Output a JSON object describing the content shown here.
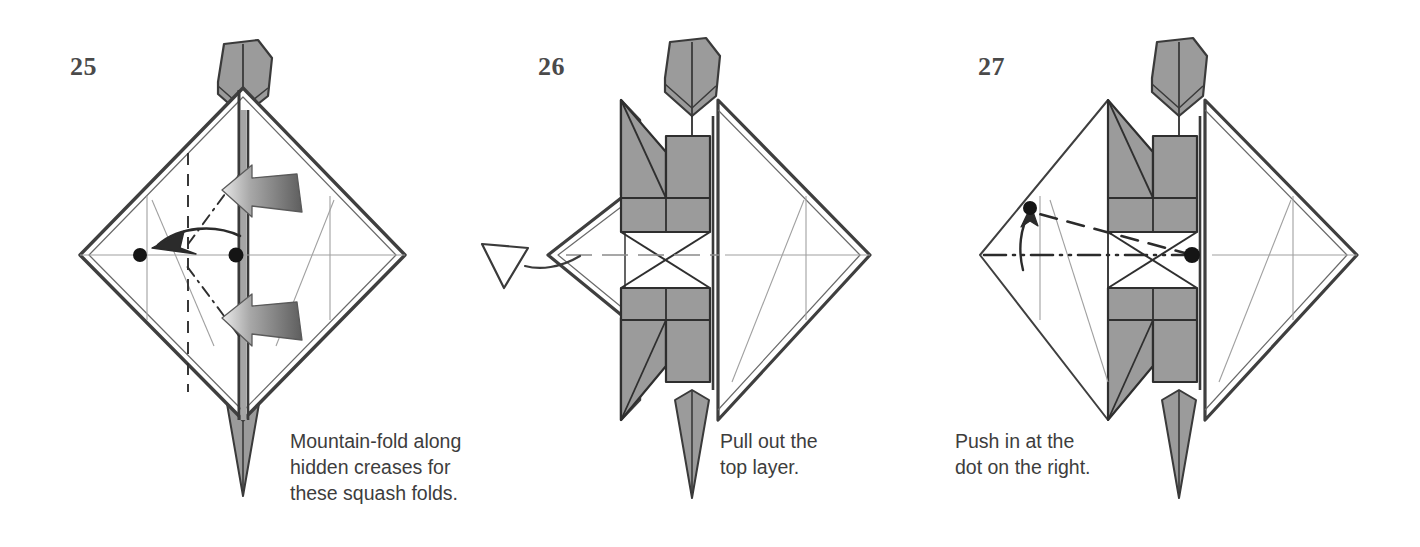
{
  "page": {
    "type": "origami-instruction-diagram",
    "background_color": "#ffffff",
    "ink_color": "#3d3d3d",
    "paper_front_color": "#ffffff",
    "paper_back_color": "#9b9b9b",
    "outline_color": "#4a4a4a",
    "dot_color": "#1a1a1a"
  },
  "steps": [
    {
      "number": "25",
      "caption": "Mountain-fold along\nhidden creases for\nthese squash folds.",
      "model": "fish-base-diamond",
      "symbols": [
        "push-arrow-solid-upper",
        "push-arrow-solid-lower",
        "curved-fold-arrow-left",
        "mountain-crease-dashed-vertical",
        "hidden-crease-dash-dot-upper",
        "hidden-crease-dash-dot-lower",
        "reference-dot-left",
        "reference-dot-center"
      ]
    },
    {
      "number": "26",
      "caption": "Pull out the\ntop layer.",
      "model": "fish-base-diamond-squashed",
      "symbols": [
        "pull-out-hollow-arrow-left",
        "center-x-crease"
      ]
    },
    {
      "number": "27",
      "caption": "Push in at the\ndot on the right.",
      "model": "fish-base-diamond-squashed",
      "symbols": [
        "valley-fold-dashed-line",
        "push-in-dash-dot-dot-line",
        "curved-thin-arrow-up",
        "reference-dot-upper-left",
        "reference-dot-center"
      ]
    }
  ]
}
